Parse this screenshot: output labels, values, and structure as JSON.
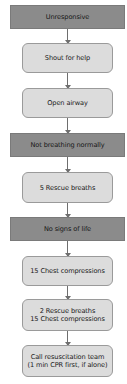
{
  "flowchart": {
    "nodes": [
      {
        "id": "unresponsive",
        "type": "condition",
        "lines": [
          "Unresponsive"
        ]
      },
      {
        "id": "shout-for-help",
        "type": "action",
        "lines": [
          "Shout for help"
        ]
      },
      {
        "id": "open-airway",
        "type": "action",
        "lines": [
          "Open airway"
        ]
      },
      {
        "id": "not-breathing-normally",
        "type": "condition",
        "lines": [
          "Not breathing normally"
        ]
      },
      {
        "id": "five-rescue-breaths",
        "type": "action",
        "lines": [
          "5 Rescue breaths"
        ]
      },
      {
        "id": "no-signs-of-life",
        "type": "condition",
        "lines": [
          "No signs of life"
        ]
      },
      {
        "id": "fifteen-chest-compressions",
        "type": "action",
        "lines": [
          "15 Chest compressions"
        ]
      },
      {
        "id": "cycle-breaths-compressions",
        "type": "action",
        "lines": [
          "2 Rescue breaths",
          "15 Chest compressions"
        ]
      },
      {
        "id": "call-resuscitation-team",
        "type": "action",
        "lines": [
          "Call resuscitation team",
          "(1 min CPR first, if alone)"
        ]
      }
    ],
    "edges": [
      [
        "unresponsive",
        "shout-for-help"
      ],
      [
        "shout-for-help",
        "open-airway"
      ],
      [
        "open-airway",
        "not-breathing-normally"
      ],
      [
        "not-breathing-normally",
        "five-rescue-breaths"
      ],
      [
        "five-rescue-breaths",
        "no-signs-of-life"
      ],
      [
        "no-signs-of-life",
        "fifteen-chest-compressions"
      ],
      [
        "fifteen-chest-compressions",
        "cycle-breaths-compressions"
      ],
      [
        "cycle-breaths-compressions",
        "call-resuscitation-team"
      ]
    ],
    "colors": {
      "condition_fill": "#8b8b8b",
      "action_fill": "#dcdcdc",
      "action_border": "#9a9a9a",
      "arrow": "#6e6e6e",
      "background": "#ffffff"
    }
  }
}
